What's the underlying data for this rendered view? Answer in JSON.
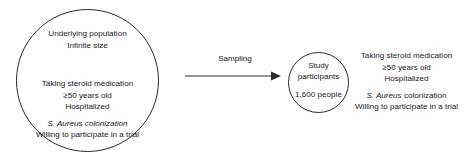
{
  "diagram": {
    "population_circle": {
      "header": [
        "Underlying population",
        "Infinite size"
      ],
      "criteria": [
        "Taking steroid medication",
        "≥50 years old",
        "Hospitalized",
        "S. Aureus colonization",
        "Willing to participate in a trial"
      ]
    },
    "arrow": {
      "label": "Sampling",
      "icon": "right-arrow-icon"
    },
    "participants_circle": {
      "title_line1": "Study",
      "title_line2": "participants",
      "count": "1,600 people"
    },
    "sample_criteria": {
      "lines": [
        "Taking steroid medication",
        "≥50 years old",
        "Hospitalized",
        "S. Aureus",
        "colonization",
        "Willing to participate in a trial"
      ]
    },
    "colors": {
      "stroke": "#2b2b2b",
      "text": "#1a1a1a",
      "background": "#ffffff"
    }
  }
}
